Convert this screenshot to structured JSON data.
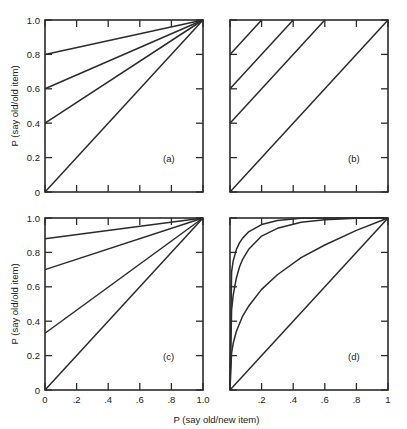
{
  "figure": {
    "axis_titles": {
      "x": "P (say old/new item)",
      "y": "P (say old/old item)"
    },
    "panel_labels": {
      "a": "(a)",
      "b": "(b)",
      "c": "(c)",
      "d": "(d)"
    },
    "tick_labels": {
      "y_full": [
        "1.0",
        "0.8",
        "0.6",
        "0.4",
        "0.2",
        "0"
      ],
      "x_full": [
        "0",
        ".2",
        ".4",
        ".6",
        ".8",
        "1.0"
      ],
      "x_short": [
        ".2",
        ".4",
        ".6",
        ".8",
        "1"
      ]
    },
    "colors": {
      "line": "#2b2b2b",
      "background": "#ffffff"
    }
  },
  "chart_data": [
    {
      "id": "a",
      "type": "line",
      "title": "(a)",
      "xlabel": "P (say old/new item)",
      "ylabel": "P (say old/old item)",
      "xlim": [
        0,
        1
      ],
      "ylim": [
        0,
        1
      ],
      "xticks": [
        0,
        0.2,
        0.4,
        0.6,
        0.8,
        1.0
      ],
      "yticks": [
        0,
        0.2,
        0.4,
        0.6,
        0.8,
        1.0
      ],
      "grid": false,
      "legend": "none",
      "description": "Threshold-model ROCs: straight lines from varying y-intercepts converging on (1,1)",
      "series": [
        {
          "name": "intercept 0.8",
          "x": [
            0,
            1
          ],
          "y": [
            0.8,
            1.0
          ]
        },
        {
          "name": "intercept 0.6",
          "x": [
            0,
            1
          ],
          "y": [
            0.6,
            1.0
          ]
        },
        {
          "name": "intercept 0.4",
          "x": [
            0,
            1
          ],
          "y": [
            0.4,
            1.0
          ]
        },
        {
          "name": "intercept 0.0",
          "x": [
            0,
            1
          ],
          "y": [
            0.0,
            1.0
          ]
        }
      ]
    },
    {
      "id": "b",
      "type": "line",
      "title": "(b)",
      "xlabel": "P (say old/new item)",
      "ylabel": "P (say old/old item)",
      "xlim": [
        0,
        1
      ],
      "ylim": [
        0,
        1
      ],
      "xticks": [
        0,
        0.2,
        0.4,
        0.6,
        0.8,
        1.0
      ],
      "yticks": [
        0,
        0.2,
        0.4,
        0.6,
        0.8,
        1.0
      ],
      "grid": false,
      "legend": "none",
      "description": "Parallel unit-slope lines with varying intercepts, clipped at y = 1",
      "series": [
        {
          "name": "intercept 0.8",
          "x": [
            0,
            0.2
          ],
          "y": [
            0.8,
            1.0
          ]
        },
        {
          "name": "intercept 0.6",
          "x": [
            0,
            0.4
          ],
          "y": [
            0.6,
            1.0
          ]
        },
        {
          "name": "intercept 0.4",
          "x": [
            0,
            0.6
          ],
          "y": [
            0.4,
            1.0
          ]
        },
        {
          "name": "intercept 0.0",
          "x": [
            0,
            1.0
          ],
          "y": [
            0.0,
            1.0
          ]
        }
      ]
    },
    {
      "id": "c",
      "type": "line",
      "title": "(c)",
      "xlabel": "P (say old/new item)",
      "ylabel": "P (say old/old item)",
      "xlim": [
        0,
        1
      ],
      "ylim": [
        0,
        1
      ],
      "xticks": [
        0,
        0.2,
        0.4,
        0.6,
        0.8,
        1.0
      ],
      "yticks": [
        0,
        0.2,
        0.4,
        0.6,
        0.8,
        1.0
      ],
      "grid": false,
      "legend": "none",
      "description": "Straight lines from unevenly spaced y-intercepts converging on (1,1)",
      "series": [
        {
          "name": "intercept 0.88",
          "x": [
            0,
            1
          ],
          "y": [
            0.88,
            1.0
          ]
        },
        {
          "name": "intercept 0.70",
          "x": [
            0,
            1
          ],
          "y": [
            0.7,
            1.0
          ]
        },
        {
          "name": "intercept 0.33",
          "x": [
            0,
            1
          ],
          "y": [
            0.33,
            1.0
          ]
        },
        {
          "name": "intercept 0.0",
          "x": [
            0,
            1
          ],
          "y": [
            0.0,
            1.0
          ]
        }
      ]
    },
    {
      "id": "d",
      "type": "line",
      "title": "(d)",
      "xlabel": "P (say old/new item)",
      "ylabel": "P (say old/old item)",
      "xlim": [
        0,
        1
      ],
      "ylim": [
        0,
        1
      ],
      "xticks": [
        0,
        0.2,
        0.4,
        0.6,
        0.8,
        1.0
      ],
      "yticks": [
        0,
        0.2,
        0.4,
        0.6,
        0.8,
        1.0
      ],
      "grid": false,
      "legend": "none",
      "description": "Curvilinear ROCs of the form y = x^(1/k) from (0,0) to (1,1) with increasing curvature",
      "series": [
        {
          "name": "k = 12",
          "x": [
            0,
            0.01,
            0.02,
            0.04,
            0.06,
            0.08,
            0.12,
            0.2,
            0.3,
            0.45,
            0.6,
            0.8,
            1.0
          ],
          "y": [
            0,
            0.687,
            0.749,
            0.816,
            0.855,
            0.883,
            0.921,
            0.962,
            0.985,
            0.9985,
            1.0,
            1.0,
            1.0
          ]
        },
        {
          "name": "k = 6",
          "x": [
            0,
            0.01,
            0.02,
            0.04,
            0.06,
            0.08,
            0.12,
            0.2,
            0.3,
            0.45,
            0.6,
            0.8,
            1.0
          ],
          "y": [
            0,
            0.464,
            0.55,
            0.65,
            0.715,
            0.76,
            0.82,
            0.895,
            0.94,
            0.975,
            0.99,
            0.998,
            1.0
          ]
        },
        {
          "name": "k = 3",
          "x": [
            0,
            0.01,
            0.02,
            0.04,
            0.08,
            0.12,
            0.2,
            0.3,
            0.45,
            0.6,
            0.8,
            1.0
          ],
          "y": [
            0,
            0.215,
            0.27,
            0.34,
            0.43,
            0.49,
            0.585,
            0.67,
            0.77,
            0.843,
            0.928,
            1.0
          ]
        },
        {
          "name": "k = 1 (chance)",
          "x": [
            0,
            0.25,
            0.5,
            0.75,
            1.0
          ],
          "y": [
            0,
            0.25,
            0.5,
            0.75,
            1.0
          ]
        }
      ]
    }
  ]
}
